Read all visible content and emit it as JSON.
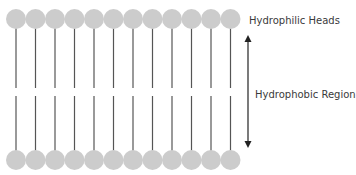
{
  "labels": {
    "heads": "Hydrophilic Heads",
    "region": "Hydrophobic Region"
  },
  "layout": {
    "count": 12,
    "start_x": 16,
    "spacing": 19.5,
    "head_radius": 10,
    "top_head_y": 19,
    "bottom_head_y": 160,
    "top_tail_end_y": 88,
    "bottom_tail_start_y": 96
  },
  "arrow": {
    "x": 248,
    "y1": 36,
    "y2": 147
  },
  "colors": {
    "head_fill": "#cccccc",
    "tail_stroke": "#555555",
    "arrow": "#222222",
    "text": "#3a3a3a"
  }
}
